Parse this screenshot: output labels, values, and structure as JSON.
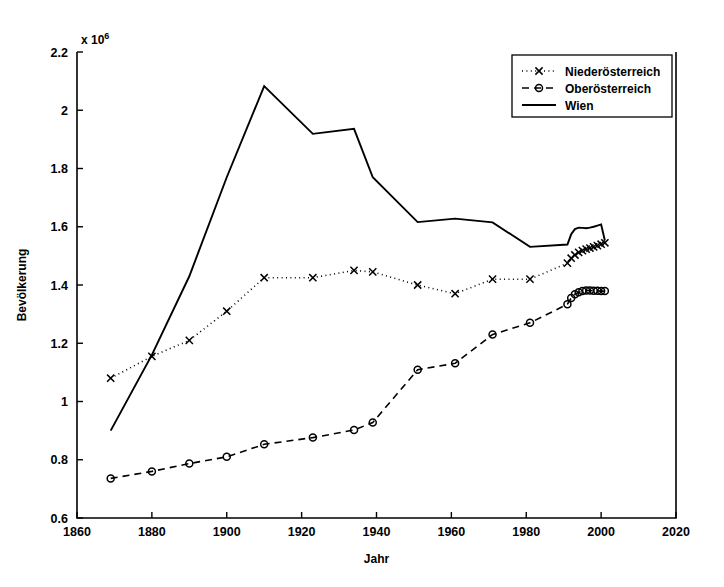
{
  "chart_data": {
    "type": "line",
    "title": "",
    "xlabel": "Jahr",
    "ylabel": "Bevölkerung",
    "y_exponent_label": "x 10",
    "y_exponent_power": "6",
    "xlim": [
      1860,
      2020
    ],
    "ylim": [
      0.6,
      2.2
    ],
    "xticks": [
      1860,
      1880,
      1900,
      1920,
      1940,
      1960,
      1980,
      2000,
      2020
    ],
    "xticklabels": [
      "1860",
      "1880",
      "1900",
      "1920",
      "1940",
      "1960",
      "1980",
      "2000",
      "2020"
    ],
    "yticks": [
      0.6,
      0.8,
      1.0,
      1.2,
      1.4,
      1.6,
      1.8,
      2.0,
      2.2
    ],
    "yticklabels": [
      "0.6",
      "0.8",
      "1",
      "1.2",
      "1.4",
      "1.6",
      "1.8",
      "2",
      "2.2"
    ],
    "y_scale_note": "values in millions (×10^6)",
    "grid": false,
    "legend_position": "upper right",
    "series": [
      {
        "name": "Niederösterreich",
        "style": "dotted",
        "marker": "x",
        "x": [
          1869,
          1880,
          1890,
          1900,
          1910,
          1923,
          1934,
          1939,
          1951,
          1961,
          1971,
          1981,
          1991,
          1992,
          1993,
          1994,
          1995,
          1996,
          1997,
          1998,
          1999,
          2000,
          2001
        ],
        "y": [
          1.08,
          1.155,
          1.21,
          1.31,
          1.425,
          1.425,
          1.45,
          1.445,
          1.4,
          1.37,
          1.42,
          1.42,
          1.475,
          1.492,
          1.503,
          1.512,
          1.518,
          1.523,
          1.527,
          1.531,
          1.535,
          1.54,
          1.545
        ]
      },
      {
        "name": "Oberösterreich",
        "style": "dashed",
        "marker": "o",
        "x": [
          1869,
          1880,
          1890,
          1900,
          1910,
          1923,
          1934,
          1939,
          1951,
          1961,
          1971,
          1981,
          1991,
          1992,
          1993,
          1994,
          1995,
          1996,
          1997,
          1998,
          1999,
          2000,
          2001
        ],
        "y": [
          0.736,
          0.76,
          0.787,
          0.81,
          0.853,
          0.876,
          0.902,
          0.928,
          1.109,
          1.131,
          1.23,
          1.27,
          1.334,
          1.355,
          1.368,
          1.375,
          1.379,
          1.381,
          1.381,
          1.38,
          1.38,
          1.379,
          1.379
        ]
      },
      {
        "name": "Wien",
        "style": "solid",
        "marker": "none",
        "x": [
          1869,
          1880,
          1890,
          1900,
          1910,
          1923,
          1934,
          1939,
          1951,
          1961,
          1971,
          1981,
          1991,
          1992,
          1993,
          1994,
          1995,
          1996,
          1997,
          1998,
          1999,
          2000,
          2001
        ],
        "y": [
          0.9,
          1.16,
          1.43,
          1.77,
          2.083,
          1.919,
          1.936,
          1.77,
          1.616,
          1.628,
          1.615,
          1.531,
          1.539,
          1.574,
          1.592,
          1.597,
          1.596,
          1.595,
          1.597,
          1.6,
          1.604,
          1.608,
          1.553
        ]
      }
    ],
    "legend_entries": [
      {
        "label": "Niederösterreich",
        "style": "dotted",
        "marker": "x"
      },
      {
        "label": "Oberösterreich",
        "style": "dashed",
        "marker": "o"
      },
      {
        "label": "Wien",
        "style": "solid",
        "marker": "none"
      }
    ]
  }
}
